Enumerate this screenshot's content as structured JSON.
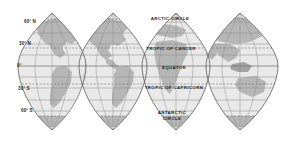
{
  "map": {
    "title": "Interrupted world map projection",
    "projection_type": "interrupted-goode-homolosine",
    "gore_count": 4,
    "colors": {
      "ocean": "#e9e9e9",
      "land": "#b6b6b6",
      "land_dark": "#a2a2a2",
      "graticule": "#8a8a8a",
      "outline": "#6e6e6e",
      "dashed_line": "#6a6a6a",
      "background": "#ffffff",
      "label_text": "#1f1f1f"
    },
    "latitude_labels": [
      {
        "id": "lat-60n",
        "text": "60° N",
        "value": 60,
        "x": 24,
        "y": 23
      },
      {
        "id": "lat-30n",
        "text": "30° N",
        "value": 30,
        "x": 19,
        "y": 45
      },
      {
        "id": "lat-0",
        "text": "0°",
        "value": 0,
        "x": 17,
        "y": 67
      },
      {
        "id": "lat-30s",
        "text": "30° S",
        "value": -30,
        "x": 18,
        "y": 90
      },
      {
        "id": "lat-60s",
        "text": "60° S",
        "value": -60,
        "x": 21,
        "y": 112
      }
    ],
    "named_lines": [
      {
        "id": "arctic-circle",
        "text": "ARCTIC CIRCLE",
        "value": 66.5,
        "x": 170,
        "y": 20,
        "style": "dashed"
      },
      {
        "id": "tropic-of-cancer",
        "text": "TROPIC OF CANCER",
        "value": 23.5,
        "x": 171,
        "y": 50,
        "style": "dashed"
      },
      {
        "id": "equator",
        "text": "EQUATOR",
        "value": 0,
        "x": 174,
        "y": 69,
        "style": "solid"
      },
      {
        "id": "tropic-of-capricorn",
        "text": "TROPIC OF CAPRICORN",
        "value": -23.5,
        "x": 174,
        "y": 89,
        "style": "dashed"
      },
      {
        "id": "antarctic-circle-1",
        "text": "ANTARCTIC",
        "value": -66.5,
        "x": 172,
        "y": 114,
        "style": "dashed"
      },
      {
        "id": "antarctic-circle-2",
        "text": "CIRCLE",
        "value": -66.5,
        "x": 172,
        "y": 120,
        "style": "dashed"
      }
    ],
    "parallels": [
      {
        "id": "p60n",
        "value": 60,
        "y": 22,
        "style": "solid"
      },
      {
        "id": "p45n",
        "value": 45,
        "y": 33,
        "style": "solid"
      },
      {
        "id": "p30n",
        "value": 30,
        "y": 44,
        "style": "solid"
      },
      {
        "id": "p235n",
        "value": 23.5,
        "y": 48,
        "style": "dashed"
      },
      {
        "id": "p15n",
        "value": 15,
        "y": 55,
        "style": "solid"
      },
      {
        "id": "p0",
        "value": 0,
        "y": 66,
        "style": "solid"
      },
      {
        "id": "p15s",
        "value": -15,
        "y": 77,
        "style": "solid"
      },
      {
        "id": "p235s",
        "value": -23.5,
        "y": 84,
        "style": "dashed"
      },
      {
        "id": "p30s",
        "value": -30,
        "y": 88,
        "style": "solid"
      },
      {
        "id": "p45s",
        "value": -45,
        "y": 100,
        "style": "solid"
      },
      {
        "id": "p60s",
        "value": -60,
        "y": 111,
        "style": "solid"
      },
      {
        "id": "p665s",
        "value": -66.5,
        "y": 116,
        "style": "dashed"
      }
    ],
    "gores": [
      {
        "id": "gore-americas-north",
        "center_x": 52,
        "half_width": 34,
        "top_y": 13,
        "bottom_y": 130
      },
      {
        "id": "gore-americas-south",
        "center_x": 113,
        "half_width": 34,
        "top_y": 13,
        "bottom_y": 130
      },
      {
        "id": "gore-africa-europe",
        "center_x": 176,
        "half_width": 34,
        "top_y": 13,
        "bottom_y": 130
      },
      {
        "id": "gore-asia-oceania",
        "center_x": 240,
        "half_width": 36,
        "top_y": 13,
        "bottom_y": 130
      }
    ]
  }
}
